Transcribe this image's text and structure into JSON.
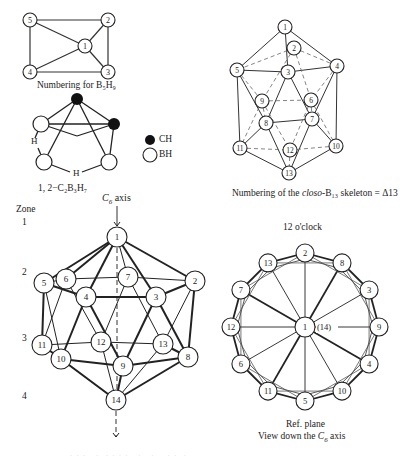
{
  "b5h9": {
    "caption": "Numbering for B₅H₉",
    "nodes": [
      {
        "id": "5",
        "x": 30,
        "y": 20
      },
      {
        "id": "2",
        "x": 108,
        "y": 20
      },
      {
        "id": "1",
        "x": 85,
        "y": 46
      },
      {
        "id": "4",
        "x": 30,
        "y": 72
      },
      {
        "id": "3",
        "x": 108,
        "y": 72
      }
    ],
    "edges": [
      [
        "5",
        "2"
      ],
      [
        "2",
        "3"
      ],
      [
        "3",
        "4"
      ],
      [
        "4",
        "5"
      ],
      [
        "5",
        "1"
      ],
      [
        "2",
        "1"
      ],
      [
        "3",
        "1"
      ],
      [
        "4",
        "1"
      ]
    ]
  },
  "c2b3h7": {
    "caption": "1, 2−C₂B₃H₇",
    "bridge_h_left": "H",
    "bridge_h_bottom": "H",
    "legend": [
      {
        "symbol": "filled-circle",
        "label": "CH"
      },
      {
        "symbol": "open-circle",
        "label": "BH"
      }
    ]
  },
  "delta13": {
    "caption_prefix": "Numbering of the ",
    "caption_italic": "closo",
    "caption_suffix": "-B₁₃ skeleton = Δ13",
    "nodes": [
      {
        "id": "1",
        "x": 285,
        "y": 27
      },
      {
        "id": "2",
        "x": 294,
        "y": 48
      },
      {
        "id": "4",
        "x": 337,
        "y": 66
      },
      {
        "id": "5",
        "x": 237,
        "y": 70
      },
      {
        "id": "3",
        "x": 288,
        "y": 72
      },
      {
        "id": "9",
        "x": 262,
        "y": 101
      },
      {
        "id": "6",
        "x": 311,
        "y": 100
      },
      {
        "id": "8",
        "x": 266,
        "y": 123
      },
      {
        "id": "7",
        "x": 312,
        "y": 119
      },
      {
        "id": "11",
        "x": 240,
        "y": 148
      },
      {
        "id": "12",
        "x": 290,
        "y": 150
      },
      {
        "id": "10",
        "x": 336,
        "y": 146
      },
      {
        "id": "13",
        "x": 289,
        "y": 173
      }
    ]
  },
  "icosahedron": {
    "axis_label_italic": "C",
    "axis_label_sub": "6",
    "axis_label_rest": " axis",
    "zone_header": "Zone",
    "zones": [
      {
        "label": "1",
        "y": 256
      },
      {
        "label": "2",
        "y": 274
      },
      {
        "label": "3",
        "y": 340
      },
      {
        "label": "4",
        "y": 398
      }
    ],
    "nodes": [
      {
        "id": "1",
        "x": 117,
        "y": 237
      },
      {
        "id": "6",
        "x": 66,
        "y": 279
      },
      {
        "id": "7",
        "x": 128,
        "y": 277
      },
      {
        "id": "5",
        "x": 44,
        "y": 283
      },
      {
        "id": "2",
        "x": 195,
        "y": 281
      },
      {
        "id": "4",
        "x": 86,
        "y": 297
      },
      {
        "id": "3",
        "x": 156,
        "y": 297
      },
      {
        "id": "11",
        "x": 42,
        "y": 345
      },
      {
        "id": "12",
        "x": 101,
        "y": 342
      },
      {
        "id": "13",
        "x": 163,
        "y": 344
      },
      {
        "id": "10",
        "x": 61,
        "y": 359
      },
      {
        "id": "9",
        "x": 123,
        "y": 366
      },
      {
        "id": "8",
        "x": 188,
        "y": 357
      },
      {
        "id": "14",
        "x": 116,
        "y": 400
      }
    ]
  },
  "wheel": {
    "top_label": "12 o'clock",
    "center_label": "1",
    "center_secondary": "(14)",
    "ref_plane_label": "Ref. plane",
    "view_label_prefix": "View down the ",
    "view_label_italic": "C",
    "view_label_sub": "6",
    "view_label_suffix": " axis",
    "outer_nodes": [
      "2",
      "8",
      "3",
      "9",
      "4",
      "10",
      "5",
      "11",
      "6",
      "12",
      "7",
      "13"
    ]
  },
  "footer_caption_faint": "Figure caption (illegible, faint)"
}
